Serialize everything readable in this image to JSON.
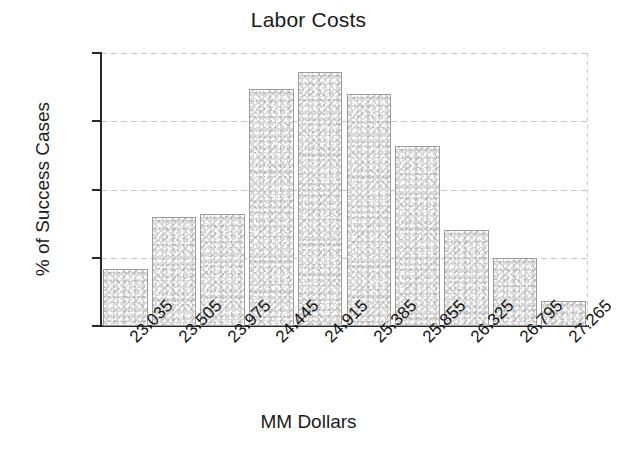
{
  "chart_data": {
    "type": "bar",
    "title": "Labor Costs",
    "xlabel": "MM Dollars",
    "ylabel": "% of Success Cases",
    "categories": [
      "23.035",
      "23.505",
      "23.975",
      "24.445",
      "24.915",
      "25.385",
      "25.855",
      "26.325",
      "26.795",
      "27.265"
    ],
    "values": [
      4.2,
      8.0,
      8.2,
      17.4,
      18.6,
      17.0,
      13.2,
      7.0,
      5.0,
      1.8
    ],
    "ylim": [
      0,
      20
    ],
    "yticks": [
      "0",
      "5",
      "10",
      "15",
      "20"
    ],
    "ytick_values": [
      0,
      5,
      10,
      15,
      20
    ],
    "grid": "horizontal-dashed",
    "legend": "none",
    "bar_fill": "#d9d9d9",
    "bar_edge": "#9b9b9b",
    "axis_color": "#272727"
  }
}
